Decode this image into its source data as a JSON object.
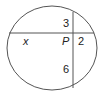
{
  "diagram": {
    "type": "intersecting-chords",
    "circle": {
      "cx": 52,
      "cy": 48,
      "rx": 45,
      "ry": 42
    },
    "intersection_label": "P",
    "horizontal_chord": {
      "left_segment": "x",
      "right_segment": "2"
    },
    "vertical_chord": {
      "top_segment": "3",
      "bottom_segment": "6"
    },
    "stroke_color": "#555555"
  }
}
